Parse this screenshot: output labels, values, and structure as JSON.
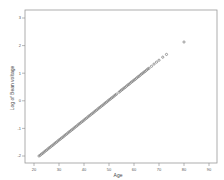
{
  "chart_data": {
    "type": "scatter",
    "title": "",
    "xlabel": "Age",
    "ylabel": "Log of Bean voltage",
    "xlim": [
      17,
      94
    ],
    "ylim": [
      -2.3,
      3.3
    ],
    "xticks": [
      20,
      30,
      40,
      50,
      60,
      70,
      80,
      90
    ],
    "yticks": [
      -2,
      -1,
      0,
      1,
      2,
      3
    ],
    "ytick_labels": [
      "-2",
      "-1",
      "0",
      "1",
      "2",
      "3"
    ],
    "grid": false,
    "legend": null,
    "marker_color": "#777777",
    "series": [
      {
        "name": "points",
        "x": [
          22,
          22.5,
          23,
          23.5,
          24,
          24.5,
          25,
          25.5,
          26,
          26.5,
          27,
          27.5,
          28,
          28.5,
          29,
          29.5,
          30,
          30.5,
          31,
          31.5,
          32,
          32.5,
          33,
          33.5,
          34,
          34.5,
          35,
          35.5,
          36,
          36.5,
          37,
          37.5,
          38,
          38.5,
          39,
          39.5,
          40,
          40.5,
          41,
          41.5,
          42,
          42.5,
          43,
          43.5,
          44,
          44.5,
          45,
          45.5,
          46,
          46.5,
          47,
          47.5,
          48,
          48.5,
          49,
          49.5,
          50,
          50.5,
          51,
          51.5,
          52,
          52.5,
          53,
          54,
          54.5,
          55,
          55.5,
          56,
          56.5,
          57,
          57.5,
          58,
          58.5,
          59,
          59.5,
          60,
          60.5,
          61,
          61.5,
          62,
          62.5,
          63,
          63.5,
          64,
          64.5,
          65,
          65.5,
          66,
          67,
          68,
          69,
          70,
          71.5,
          73,
          80
        ],
        "y": [
          -2.0,
          -1.97,
          -1.93,
          -1.9,
          -1.86,
          -1.82,
          -1.79,
          -1.75,
          -1.71,
          -1.68,
          -1.64,
          -1.61,
          -1.57,
          -1.53,
          -1.5,
          -1.46,
          -1.42,
          -1.39,
          -1.35,
          -1.32,
          -1.28,
          -1.24,
          -1.21,
          -1.17,
          -1.13,
          -1.1,
          -1.06,
          -1.03,
          -0.99,
          -0.95,
          -0.92,
          -0.88,
          -0.84,
          -0.81,
          -0.77,
          -0.74,
          -0.7,
          -0.66,
          -0.63,
          -0.59,
          -0.55,
          -0.52,
          -0.48,
          -0.45,
          -0.41,
          -0.37,
          -0.34,
          -0.3,
          -0.26,
          -0.23,
          -0.19,
          -0.16,
          -0.12,
          -0.08,
          -0.05,
          -0.01,
          0.03,
          0.06,
          0.1,
          0.13,
          0.17,
          0.21,
          0.24,
          0.31,
          0.35,
          0.39,
          0.42,
          0.46,
          0.49,
          0.53,
          0.57,
          0.6,
          0.64,
          0.68,
          0.71,
          0.75,
          0.78,
          0.82,
          0.86,
          0.89,
          0.93,
          0.97,
          1.0,
          1.04,
          1.07,
          1.11,
          1.15,
          1.18,
          1.25,
          1.33,
          1.4,
          1.47,
          1.58,
          1.68,
          2.13
        ]
      }
    ]
  }
}
